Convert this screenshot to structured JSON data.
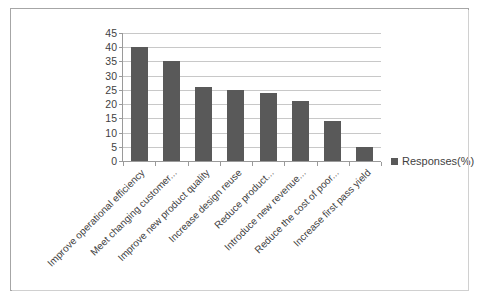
{
  "chart_data": {
    "type": "bar",
    "title": "",
    "subtitle": "",
    "xlabel": "",
    "ylabel": "",
    "ylim": [
      0,
      45
    ],
    "ytick_step": 5,
    "yticks": [
      "45",
      "40",
      "35",
      "30",
      "25",
      "20",
      "15",
      "10",
      "5",
      "0"
    ],
    "grid": true,
    "legend_position": "right",
    "categories": [
      "Improve operational efficiency",
      "Meet changing customer...",
      "Improve new product quality",
      "Increase design reuse",
      "Reduce product...",
      "Introduce new revenue...",
      "Reduce the cost of poor...",
      "Increase first pass yield"
    ],
    "series": [
      {
        "name": "Responses(%)",
        "color": "#595959",
        "values": [
          40,
          35,
          26,
          25,
          24,
          21,
          14,
          5
        ]
      }
    ]
  },
  "legend": {
    "entries": [
      {
        "label": "Responses(%)",
        "color": "#595959"
      }
    ]
  },
  "colors": {
    "bar": "#595959",
    "gridline": "#c8c8c8",
    "axis": "#9a9a9a",
    "frame": "#a6a6a6",
    "text": "#3f3f3f",
    "background": "#ffffff"
  }
}
